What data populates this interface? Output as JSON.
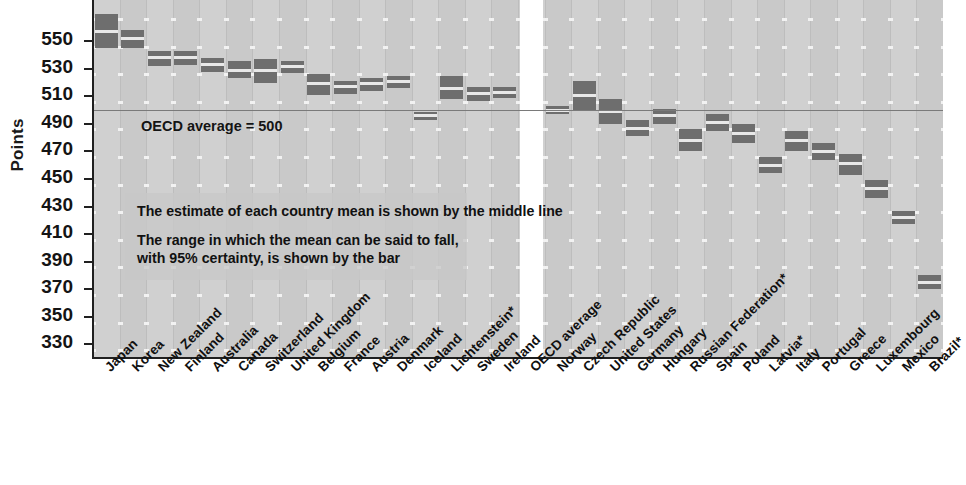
{
  "chart_data": {
    "type": "bar",
    "title": "",
    "subtitle": "",
    "xlabel": "",
    "ylabel": "Points",
    "ylim": [
      320,
      580
    ],
    "yticks": [
      330,
      350,
      370,
      390,
      410,
      430,
      450,
      470,
      490,
      510,
      530,
      550
    ],
    "ytick_labels": [
      "330",
      "350",
      "370",
      "390",
      "410",
      "430",
      "450",
      "470",
      "490",
      "510",
      "530",
      "550"
    ],
    "ytick_labels_shown": [
      "330",
      "370",
      "410",
      "450",
      "490",
      "530",
      "550"
    ],
    "grid": false,
    "legend_position": "none",
    "reference_line": {
      "label": "OECD average = 500",
      "value": 500,
      "color": "#7a7a7a"
    },
    "annotations": [
      "The estimate of each country mean is shown by the middle line",
      "The range in which the mean can be said to fall,",
      "with 95% certainty, is shown by the bar"
    ],
    "categories": [
      "Japan",
      "Korea",
      "New Zealand",
      "Finland",
      "Australia",
      "Canada",
      "Switzerland",
      "United Kingdom",
      "Belgium",
      "France",
      "Austria",
      "Denmark",
      "Iceland",
      "Lichtenstein*",
      "Sweden",
      "Ireland",
      "OECD average",
      "Norway",
      "Czech Republic",
      "United States",
      "Germany",
      "Hungary",
      "Russian Federation*",
      "Spain",
      "Poland",
      "Latvia*",
      "Italy",
      "Portugal",
      "Greece",
      "Luxembourg",
      "Mexico",
      "Brazil*"
    ],
    "values": [
      557,
      552,
      538,
      538,
      533,
      529,
      529,
      532,
      519,
      517,
      519,
      521,
      496,
      516,
      512,
      513,
      500,
      500,
      511,
      499,
      487,
      496,
      478,
      491,
      483,
      460,
      478,
      470,
      461,
      443,
      422,
      375
    ],
    "series": [
      {
        "name": "Mean science score",
        "mean": [
          557,
          552,
          538,
          538,
          533,
          529,
          529,
          532,
          519,
          517,
          519,
          521,
          496,
          516,
          512,
          513,
          500,
          500,
          511,
          499,
          487,
          496,
          478,
          491,
          483,
          460,
          478,
          470,
          461,
          443,
          422,
          375
        ],
        "ci_low": [
          545,
          545,
          532,
          533,
          528,
          523,
          520,
          527,
          511,
          512,
          514,
          516,
          493,
          508,
          507,
          509,
          499,
          497,
          500,
          490,
          481,
          490,
          470,
          485,
          476,
          454,
          470,
          464,
          453,
          436,
          417,
          370
        ],
        "ci_high": [
          570,
          558,
          543,
          543,
          538,
          536,
          537,
          536,
          526,
          521,
          523,
          525,
          499,
          525,
          517,
          517,
          501,
          503,
          521,
          508,
          493,
          501,
          486,
          497,
          490,
          466,
          485,
          476,
          468,
          449,
          427,
          380
        ]
      }
    ]
  },
  "axis": {
    "y_title": "Points"
  },
  "style": {
    "plot_background": "#c9c9c9",
    "band_color": "#d0d0d0",
    "bar_color": "#6e6e6e",
    "mean_line_color": "#e8e8e8",
    "reference_line_color": "#7a7a7a",
    "annotation_background": "rgba(200,200,200,0.8)",
    "gap_color": "#ffffff",
    "axis_color": "#202020",
    "text_color": "#141414"
  }
}
